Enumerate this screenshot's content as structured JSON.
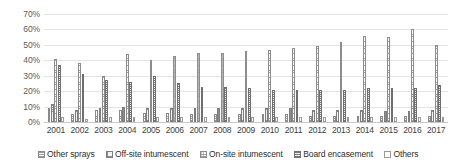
{
  "chart_data": {
    "type": "bar",
    "title": "",
    "subtitle": "",
    "xlabel": "",
    "ylabel": "",
    "ylim": [
      0,
      70
    ],
    "ytick_labels": [
      "0%",
      "10%",
      "20%",
      "30%",
      "40%",
      "50%",
      "60%",
      "70%"
    ],
    "ytick_values": [
      0,
      10,
      20,
      30,
      40,
      50,
      60,
      70
    ],
    "grid": true,
    "legend_position": "bottom",
    "grouping": "grouped",
    "unit": "%",
    "categories": [
      "2001",
      "2002",
      "2003",
      "2004",
      "2005",
      "2006",
      "2007",
      "2008",
      "2009",
      "2010",
      "2011",
      "2012",
      "2013",
      "2014",
      "2015",
      "2016",
      "2017"
    ],
    "series": [
      {
        "name": "Other sprays",
        "pattern": "horizontal-lines",
        "values": [
          9,
          5,
          8,
          8,
          6,
          6,
          5,
          5,
          5,
          5,
          5,
          4,
          4,
          4,
          4,
          4,
          4
        ]
      },
      {
        "name": "Off-site intumescent",
        "pattern": "fine-grid",
        "values": [
          12,
          8,
          9,
          10,
          9,
          9,
          9,
          9,
          9,
          9,
          9,
          8,
          8,
          8,
          7,
          7,
          8
        ]
      },
      {
        "name": "On-site intumescent",
        "pattern": "dotted-grid",
        "values": [
          41,
          38,
          30,
          44,
          40,
          43,
          45,
          45,
          46,
          47,
          48,
          49,
          52,
          56,
          55,
          60,
          50
        ]
      },
      {
        "name": "Board encasement",
        "pattern": "dense-grid",
        "values": [
          37,
          31,
          27,
          26,
          30,
          25,
          23,
          23,
          22,
          21,
          21,
          21,
          21,
          22,
          22,
          22,
          24
        ]
      },
      {
        "name": "Others",
        "pattern": "sparse-lines",
        "values": [
          3,
          2,
          3,
          3,
          3,
          3,
          3,
          3,
          3,
          3,
          3,
          3,
          3,
          3,
          3,
          3,
          3
        ]
      }
    ]
  },
  "legend": {
    "items": [
      {
        "label": "Other sprays"
      },
      {
        "label": "Off-site intumescent"
      },
      {
        "label": "On-site intumescent"
      },
      {
        "label": "Board encasement"
      },
      {
        "label": "Others"
      }
    ]
  }
}
